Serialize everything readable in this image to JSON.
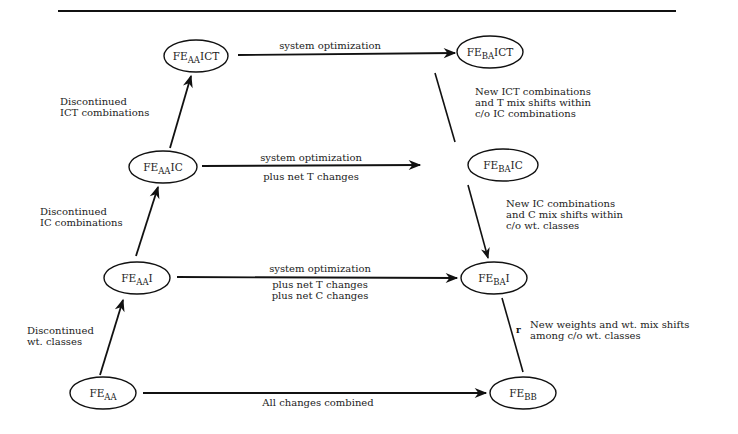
{
  "nodes": {
    "fe_aa": {
      "base": "FE",
      "sub": "AA",
      "suffix": ""
    },
    "fe_aa_i": {
      "base": "FE",
      "sub": "AA",
      "suffix": "I"
    },
    "fe_aa_ic": {
      "base": "FE",
      "sub": "AA",
      "suffix": "IC"
    },
    "fe_aa_ict": {
      "base": "FE",
      "sub": "AA",
      "suffix": "ICT"
    },
    "fe_ba_ict": {
      "base": "FE",
      "sub": "BA",
      "suffix": "ICT"
    },
    "fe_ba_ic": {
      "base": "FE",
      "sub": "BA",
      "suffix": "IC"
    },
    "fe_ba_i": {
      "base": "FE",
      "sub": "BA",
      "suffix": "I"
    },
    "fe_bb": {
      "base": "FE",
      "sub": "BB",
      "suffix": ""
    }
  },
  "edges": {
    "top_h": {
      "line1": "system optimization"
    },
    "ic_h": {
      "line1": "system optimization",
      "line2": "plus net T changes"
    },
    "i_h": {
      "line1": "system optimization",
      "line2": "plus net T changes",
      "line3": "plus net C changes"
    },
    "bottom_h": {
      "line1": "All changes combined"
    },
    "left_1": {
      "line1": "Discontinued",
      "line2": "wt. classes"
    },
    "left_2": {
      "line1": "Discontinued",
      "line2": "IC combinations"
    },
    "left_3": {
      "line1": "Discontinued",
      "line2": "ICT combinations"
    },
    "right_1": {
      "line1": "New ICT combinations",
      "line2": "and T mix shifts within",
      "line3": "c/o IC combinations"
    },
    "right_2": {
      "line1": "New IC combinations",
      "line2": "and C mix shifts within",
      "line3": "c/o wt. classes"
    },
    "right_3": {
      "line1": "New weights and wt. mix shifts",
      "line2": "among c/o wt. classes"
    }
  },
  "colors": {
    "ink": "#111111"
  }
}
